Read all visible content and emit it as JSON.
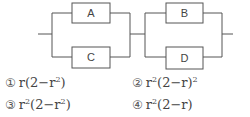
{
  "diagram": {
    "blocks": [
      {
        "id": "A",
        "label": "A",
        "group": "left",
        "position": "top"
      },
      {
        "id": "C",
        "label": "C",
        "group": "left",
        "position": "bottom"
      },
      {
        "id": "B",
        "label": "B",
        "group": "right",
        "position": "top"
      },
      {
        "id": "D",
        "label": "D",
        "group": "right",
        "position": "bottom"
      }
    ],
    "structure": "(A || C) in series with (B || D)",
    "line_color": "#444444"
  },
  "options": [
    {
      "num": "①",
      "base": "r(2−r",
      "exp": "2",
      "tail": ")"
    },
    {
      "num": "②",
      "base": "r",
      "exp0": "2",
      "mid": "(2−r)",
      "exp": "2"
    },
    {
      "num": "③",
      "base": "r",
      "exp0": "2",
      "mid": "(2−r",
      "exp": "2",
      "tail": ")"
    },
    {
      "num": "④",
      "base": "r",
      "exp0": "2",
      "mid": "(2−r)"
    }
  ]
}
